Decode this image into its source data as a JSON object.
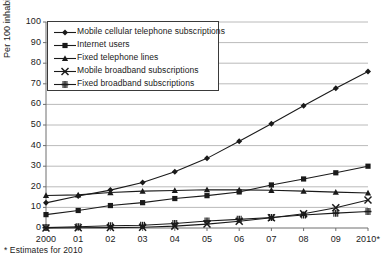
{
  "chart_data": {
    "type": "line",
    "title": "",
    "xlabel": "",
    "ylabel": "Per 100 inhabitants",
    "ylim": [
      0,
      100
    ],
    "ytick_step": 10,
    "yticks": [
      100,
      90,
      80,
      70,
      60,
      50,
      40,
      30,
      20,
      10,
      0
    ],
    "grid": true,
    "legend_position": "top-left-inside",
    "categories": [
      "2000",
      "01",
      "02",
      "03",
      "04",
      "05",
      "06",
      "07",
      "08",
      "09",
      "2010*"
    ],
    "series": [
      {
        "name": "Mobile cellular telephone subscriptions",
        "marker": "diamond",
        "values": [
          12.2,
          15.5,
          18.4,
          22.1,
          27.3,
          33.8,
          42.1,
          50.6,
          59.3,
          67.8,
          76.0
        ]
      },
      {
        "name": "Internet users",
        "marker": "square",
        "values": [
          6.5,
          8.5,
          10.9,
          12.3,
          14.3,
          15.7,
          17.5,
          20.9,
          23.8,
          26.8,
          30.0
        ]
      },
      {
        "name": "Fixed telephone lines",
        "marker": "triangle",
        "values": [
          15.8,
          16.1,
          17.2,
          17.9,
          18.2,
          18.6,
          18.5,
          18.3,
          17.9,
          17.4,
          17.0
        ]
      },
      {
        "name": "Mobile broadband subscriptions",
        "marker": "x",
        "values": [
          0.0,
          0.1,
          0.2,
          0.4,
          0.9,
          1.9,
          3.3,
          5.0,
          6.9,
          9.8,
          13.6
        ]
      },
      {
        "name": "Fixed broadband subscriptions",
        "marker": "plus-box",
        "values": [
          0.2,
          0.6,
          1.1,
          1.3,
          2.2,
          3.4,
          4.2,
          5.1,
          6.3,
          7.2,
          8.0
        ]
      }
    ],
    "footnote": "* Estimates for 2010",
    "colors": {
      "series_line": "#1a1a1a",
      "grid": "#a8a8a8",
      "axis": "#6e6e6e",
      "background": "#ffffff"
    }
  }
}
